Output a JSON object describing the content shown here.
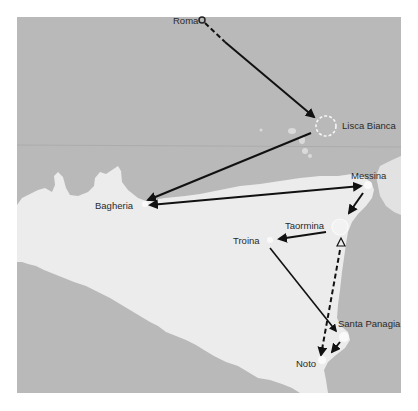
{
  "map": {
    "title": "Route map of Sicily",
    "colors": {
      "sea": "#b9b9b9",
      "land": "#ececec",
      "route": "#111111",
      "label": "#2a2a2a"
    },
    "places": [
      {
        "id": "roma",
        "label": "Roma",
        "marker": "magnifier-circle"
      },
      {
        "id": "lisca-bianca",
        "label": "Lisca Bianca",
        "marker": "dashed-circle"
      },
      {
        "id": "bagheria",
        "label": "Bagheria",
        "marker": "dot"
      },
      {
        "id": "messina",
        "label": "Messina",
        "marker": "dot"
      },
      {
        "id": "taormina",
        "label": "Taormina",
        "marker": "circle"
      },
      {
        "id": "troina",
        "label": "Troina",
        "marker": "dot"
      },
      {
        "id": "santa-panagia",
        "label": "Santa Panagia",
        "marker": "dot"
      },
      {
        "id": "noto",
        "label": "Noto",
        "marker": "dot"
      }
    ],
    "routes": [
      {
        "from": "Roma",
        "to": "Lisca Bianca",
        "style": "dashed-then-solid"
      },
      {
        "from": "Lisca Bianca",
        "to": "Bagheria",
        "style": "solid"
      },
      {
        "from": "Bagheria",
        "to": "Messina",
        "style": "solid"
      },
      {
        "from": "Messina",
        "to": "Taormina",
        "style": "solid"
      },
      {
        "from": "Taormina",
        "to": "Troina",
        "style": "solid"
      },
      {
        "from": "Troina",
        "to": "Santa Panagia",
        "style": "solid"
      },
      {
        "from": "Taormina",
        "to": "Noto",
        "style": "dashed"
      },
      {
        "from": "Santa Panagia",
        "to": "Noto",
        "style": "solid-short"
      }
    ],
    "triangle_marker": "triangle-icon"
  }
}
